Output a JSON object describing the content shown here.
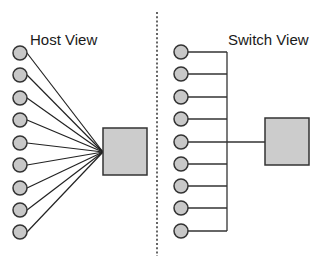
{
  "diagram": {
    "left_panel": {
      "title": "Host View",
      "node_count": 9,
      "device": "host-box"
    },
    "right_panel": {
      "title": "Switch View",
      "node_count": 9,
      "device": "switch-box"
    },
    "colors": {
      "node_fill": "#c8c8c8",
      "box_fill": "#cccccc",
      "stroke": "#333333",
      "divider": "#333333"
    }
  }
}
